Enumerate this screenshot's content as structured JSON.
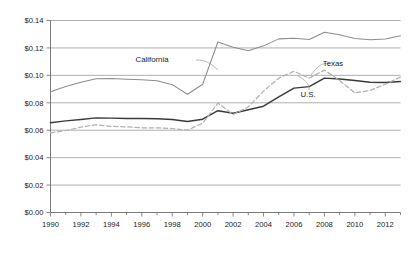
{
  "chart_data": {
    "type": "line",
    "title": "",
    "xlabel": "",
    "ylabel": "",
    "xlim": [
      1990,
      2013
    ],
    "ylim": [
      0.0,
      0.14
    ],
    "grid": true,
    "grid_axis": "y",
    "legend_position": "inline-annotations",
    "x": [
      1990,
      1991,
      1992,
      1993,
      1994,
      1995,
      1996,
      1997,
      1998,
      1999,
      2000,
      2001,
      2002,
      2003,
      2004,
      2005,
      2006,
      2007,
      2008,
      2009,
      2010,
      2011,
      2012,
      2013
    ],
    "xtick_labels": [
      "1990",
      "1992",
      "1994",
      "1996",
      "1998",
      "2000",
      "2002",
      "2004",
      "2006",
      "2008",
      "2010",
      "2012"
    ],
    "xtick_values": [
      1990,
      1992,
      1994,
      1996,
      1998,
      2000,
      2002,
      2004,
      2006,
      2008,
      2010,
      2012
    ],
    "ytick_labels": [
      "$0.00",
      "$0.02",
      "$0.04",
      "$0.06",
      "$0.08",
      "$0.10",
      "$0.12",
      "$0.14"
    ],
    "ytick_values": [
      0.0,
      0.02,
      0.04,
      0.06,
      0.08,
      0.1,
      0.12,
      0.14
    ],
    "series": [
      {
        "name": "California",
        "style": "solid",
        "color": "#8d8d8d",
        "label_text": "California",
        "values": [
          0.088,
          0.0918,
          0.095,
          0.0975,
          0.0977,
          0.0972,
          0.0968,
          0.096,
          0.0932,
          0.0862,
          0.0935,
          0.1243,
          0.1205,
          0.118,
          0.1215,
          0.1266,
          0.127,
          0.1262,
          0.1315,
          0.1296,
          0.1268,
          0.1259,
          0.1265,
          0.1288
        ]
      },
      {
        "name": "U.S.",
        "style": "solid",
        "color": "#3a3a3a",
        "label_text": "U.S.",
        "values": [
          0.0655,
          0.0668,
          0.0678,
          0.069,
          0.0688,
          0.0686,
          0.0686,
          0.0684,
          0.0678,
          0.0664,
          0.068,
          0.0742,
          0.0724,
          0.0749,
          0.0775,
          0.0843,
          0.0907,
          0.0918,
          0.098,
          0.0974,
          0.0962,
          0.095,
          0.0948,
          0.0955
        ]
      },
      {
        "name": "Texas",
        "style": "dashed",
        "color": "#b2b2b2",
        "label_text": "Texas",
        "values": [
          0.058,
          0.0598,
          0.0622,
          0.064,
          0.0628,
          0.0625,
          0.0618,
          0.0618,
          0.0612,
          0.06,
          0.0651,
          0.0798,
          0.0715,
          0.077,
          0.0885,
          0.098,
          0.103,
          0.098,
          0.1038,
          0.0963,
          0.0872,
          0.089,
          0.0935,
          0.0988
        ]
      }
    ],
    "annotations": [
      {
        "text": "California",
        "x_px": 152,
        "y_px": 62,
        "leader": true
      },
      {
        "text": "Texas",
        "x_px": 333,
        "y_px": 66,
        "leader": true
      },
      {
        "text": "U.S.",
        "x_px": 308,
        "y_px": 97,
        "leader": true
      }
    ]
  }
}
